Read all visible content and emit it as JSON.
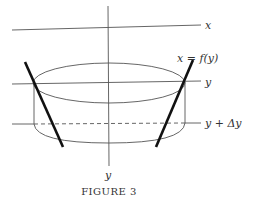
{
  "figure": {
    "caption": "Figure 3",
    "caption_display": "FIGURE 3",
    "labels": {
      "x_axis": "x",
      "y_level": "y",
      "y_delta_level": "y + Δy",
      "curve": "x = f(y)",
      "y_axis": "y"
    },
    "colors": {
      "line": "#444444",
      "thick_line": "#111111",
      "background": "#ffffff"
    }
  }
}
